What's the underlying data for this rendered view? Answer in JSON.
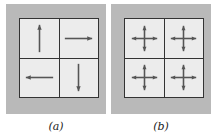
{
  "figure": {
    "panels": [
      {
        "id": "a",
        "caption": "(a)",
        "cells": [
          {
            "position": "top-left",
            "arrows": [
              "up"
            ]
          },
          {
            "position": "top-right",
            "arrows": [
              "right"
            ]
          },
          {
            "position": "bottom-left",
            "arrows": [
              "left"
            ]
          },
          {
            "position": "bottom-right",
            "arrows": [
              "down"
            ]
          }
        ]
      },
      {
        "id": "b",
        "caption": "(b)",
        "cells": [
          {
            "position": "top-left",
            "arrows": [
              "up",
              "right",
              "down",
              "left"
            ]
          },
          {
            "position": "top-right",
            "arrows": [
              "up",
              "right",
              "down",
              "left"
            ]
          },
          {
            "position": "bottom-left",
            "arrows": [
              "up",
              "right",
              "down",
              "left"
            ]
          },
          {
            "position": "bottom-right",
            "arrows": [
              "up",
              "right",
              "down",
              "left"
            ]
          }
        ]
      }
    ],
    "colors": {
      "panel_background": "#b9b9b9",
      "cell_background": "#ececec",
      "grid_line": "#333333",
      "arrow": "#555555"
    }
  }
}
